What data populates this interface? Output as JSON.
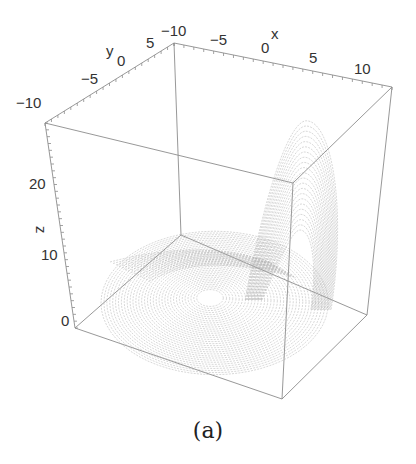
{
  "chart_data": {
    "type": "line3d",
    "title": "",
    "caption": "(a)",
    "axes": {
      "x": {
        "label": "x",
        "ticks": [
          -10,
          -5,
          0,
          5,
          10
        ],
        "tick_labels": [
          "−10",
          "−5",
          "0",
          "5",
          "10"
        ],
        "range": [
          -11,
          12
        ]
      },
      "y": {
        "label": "y",
        "ticks": [
          -10,
          -5,
          0,
          5
        ],
        "tick_labels": [
          "−10",
          "−5",
          "0",
          "5"
        ],
        "range": [
          -11,
          8
        ]
      },
      "z": {
        "label": "z",
        "ticks": [
          0,
          10,
          20
        ],
        "tick_labels": [
          "0",
          "10",
          "20"
        ],
        "range": [
          0,
          30
        ]
      }
    },
    "series": [
      {
        "name": "trajectory",
        "color": "#9a9a9a",
        "features": {
          "spiral_disk_center_xy": [
            -1,
            0
          ],
          "spiral_disk_radius_max": 10,
          "spike_peak_z": 27,
          "spike_location_x": 7
        }
      }
    ],
    "box": true,
    "grid": false,
    "legend": "none"
  },
  "labels": {
    "x_axis": "x",
    "y_axis": "y",
    "z_axis": "z",
    "caption": "(a)",
    "x_ticks": [
      "−10",
      "−5",
      "0",
      "5",
      "10"
    ],
    "y_ticks": [
      "−10",
      "−5",
      "0",
      "5"
    ],
    "z_ticks": [
      "0",
      "10",
      "20"
    ]
  },
  "colors": {
    "box": "#8c8c8c",
    "curve": "#9a9a9a",
    "text": "#333333"
  }
}
